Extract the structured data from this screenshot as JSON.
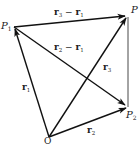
{
  "diagram": {
    "points": {
      "O": {
        "label": "O",
        "sub": "",
        "x": 49,
        "y": 137
      },
      "P1": {
        "label": "P",
        "sub": "1",
        "x": 14,
        "y": 27
      },
      "P2": {
        "label": "P",
        "sub": "2",
        "x": 128,
        "y": 107
      },
      "P3": {
        "label": "P",
        "sub": "",
        "x": 128,
        "y": 16
      }
    },
    "vectors": [
      {
        "name": "r1",
        "label": "r",
        "sub": "1",
        "from": "O",
        "to": "P1"
      },
      {
        "name": "r2",
        "label": "r",
        "sub": "2",
        "from": "O",
        "to": "P2"
      },
      {
        "name": "r3",
        "label": "r",
        "sub": "3",
        "from": "O",
        "to": "P3"
      },
      {
        "name": "r3-r1",
        "label": "r",
        "sub": "3",
        "minus": " − ",
        "label2": "r",
        "sub2": "1",
        "from": "P1",
        "to": "P3"
      },
      {
        "name": "r2-r1",
        "label": "r",
        "sub": "2",
        "minus": " − ",
        "label2": "r",
        "sub2": "1",
        "from": "P1",
        "to": "P2"
      }
    ],
    "segments": [
      {
        "name": "P3-P2",
        "from": "P3",
        "to": "P2"
      }
    ],
    "colors": {
      "line": "#111111",
      "background": "#ffffff"
    }
  }
}
